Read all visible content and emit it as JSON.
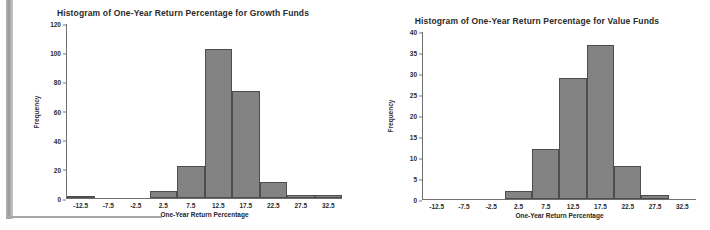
{
  "chart_data": [
    {
      "type": "bar",
      "name": "growth-funds-histogram",
      "title": "Histogram of One-Year Return Percentage for Growth Funds",
      "xlabel": "One-Year Return Percentage",
      "ylabel": "Frequency",
      "categories": [
        "-12.5",
        "-7.5",
        "-2.5",
        "2.5",
        "7.5",
        "12.5",
        "17.5",
        "22.5",
        "27.5",
        "32.5"
      ],
      "values": [
        1,
        0,
        0,
        5,
        22,
        103,
        74,
        11,
        2,
        2
      ],
      "ylim": [
        0,
        120
      ],
      "yticks": [
        0,
        20,
        40,
        60,
        80,
        100,
        120
      ],
      "grid": false,
      "legend": "none",
      "bar_fill": "#838383",
      "bar_stroke": "#4d4d4d"
    },
    {
      "type": "bar",
      "name": "value-funds-histogram",
      "title": "Histogram of One-Year Return Percentage for Value Funds",
      "xlabel": "One-Year Return Percentage",
      "ylabel": "Frequency",
      "categories": [
        "-12.5",
        "-7.5",
        "-2.5",
        "2.5",
        "7.5",
        "12.5",
        "17.5",
        "22.5",
        "27.5",
        "32.5"
      ],
      "values": [
        0,
        0,
        0,
        2,
        12,
        29,
        37,
        8,
        1,
        0
      ],
      "ylim": [
        0,
        40
      ],
      "yticks": [
        0,
        5,
        10,
        15,
        20,
        25,
        30,
        35,
        40
      ],
      "grid": false,
      "legend": "none",
      "bar_fill": "#838383",
      "bar_stroke": "#4d4d4d"
    }
  ],
  "artifacts": {
    "top_noise_text": "  "
  }
}
